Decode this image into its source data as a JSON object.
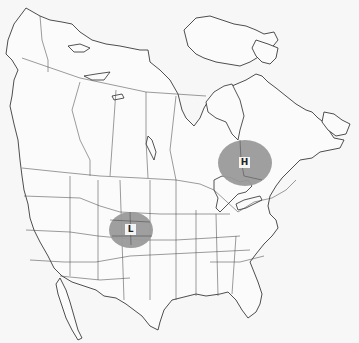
{
  "map": {
    "region": "North America (Canada, United States, northern Mexico)",
    "style": "outline base map with state/province borders",
    "colors": {
      "background": "#f7f7f7",
      "outline": "#3a3a3a",
      "pressure_area": "#9a9a9a",
      "label_background": "#f4f4f4"
    }
  },
  "pressure_systems": [
    {
      "id": "high",
      "label": "H",
      "meaning": "High pressure",
      "location": "Ontario / Quebec, north of the Great Lakes",
      "cx": 245,
      "cy": 163,
      "rx": 27,
      "ry": 23
    },
    {
      "id": "low",
      "label": "L",
      "meaning": "Low pressure",
      "location": "Colorado / Kansas / Nebraska border",
      "cx": 131,
      "cy": 230,
      "rx": 22,
      "ry": 18
    }
  ]
}
